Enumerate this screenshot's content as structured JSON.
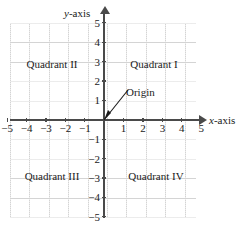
{
  "diagram": {
    "axes": {
      "x_label_prefix": "x",
      "x_label_suffix": "-axis",
      "y_label_prefix": "y",
      "y_label_suffix": "-axis",
      "x_range": [
        -5,
        5
      ],
      "y_range": [
        -5,
        5
      ],
      "grid": true,
      "axis_color": "#4a4a4a",
      "grid_color": "#d4d4d4",
      "text_color": "#1a1a1a"
    },
    "x_ticks": [
      {
        "value": -5,
        "label": "−5"
      },
      {
        "value": -4,
        "label": "−4"
      },
      {
        "value": -3,
        "label": "−3"
      },
      {
        "value": -2,
        "label": "−2"
      },
      {
        "value": -1,
        "label": "−1"
      },
      {
        "value": 1,
        "label": "1"
      },
      {
        "value": 2,
        "label": "2"
      },
      {
        "value": 3,
        "label": "3"
      },
      {
        "value": 4,
        "label": "4"
      },
      {
        "value": 5,
        "label": "5"
      }
    ],
    "y_ticks": [
      {
        "value": 5,
        "label": "5"
      },
      {
        "value": 4,
        "label": "4"
      },
      {
        "value": 3,
        "label": "3"
      },
      {
        "value": 2,
        "label": "2"
      },
      {
        "value": 1,
        "label": "1"
      },
      {
        "value": -1,
        "label": "−1"
      },
      {
        "value": -2,
        "label": "−2"
      },
      {
        "value": -3,
        "label": "−3"
      },
      {
        "value": -4,
        "label": "−4"
      },
      {
        "value": -5,
        "label": "−5"
      }
    ],
    "quadrants": [
      {
        "name": "Quadrant I",
        "x": 154,
        "y": 64
      },
      {
        "name": "Quadrant II",
        "x": 52,
        "y": 64
      },
      {
        "name": "Quadrant III",
        "x": 52,
        "y": 176
      },
      {
        "name": "Quadrant IV",
        "x": 156,
        "y": 176
      }
    ],
    "annotation": {
      "origin_label": "Origin"
    }
  }
}
